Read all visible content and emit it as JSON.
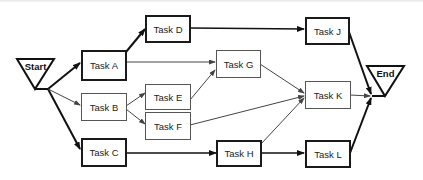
{
  "diagram": {
    "type": "network-diagram",
    "start": {
      "label": "Start"
    },
    "end": {
      "label": "End"
    },
    "tasks": [
      {
        "id": "A",
        "label": "Task A",
        "critical": true
      },
      {
        "id": "B",
        "label": "Task B",
        "critical": false
      },
      {
        "id": "C",
        "label": "Task C",
        "critical": true
      },
      {
        "id": "D",
        "label": "Task D",
        "critical": true
      },
      {
        "id": "E",
        "label": "Task E",
        "critical": false
      },
      {
        "id": "F",
        "label": "Task F",
        "critical": false
      },
      {
        "id": "G",
        "label": "Task G",
        "critical": false
      },
      {
        "id": "H",
        "label": "Task H",
        "critical": true
      },
      {
        "id": "J",
        "label": "Task J",
        "critical": true
      },
      {
        "id": "K",
        "label": "Task K",
        "critical": false
      },
      {
        "id": "L",
        "label": "Task L",
        "critical": true
      }
    ],
    "edges": [
      {
        "from": "Start",
        "to": "A",
        "critical": true
      },
      {
        "from": "Start",
        "to": "B",
        "critical": false
      },
      {
        "from": "Start",
        "to": "C",
        "critical": true
      },
      {
        "from": "A",
        "to": "D",
        "critical": true
      },
      {
        "from": "A",
        "to": "G",
        "critical": false
      },
      {
        "from": "B",
        "to": "E",
        "critical": false
      },
      {
        "from": "B",
        "to": "F",
        "critical": false
      },
      {
        "from": "E",
        "to": "G",
        "critical": false
      },
      {
        "from": "F",
        "to": "K",
        "critical": false
      },
      {
        "from": "G",
        "to": "K",
        "critical": false
      },
      {
        "from": "C",
        "to": "H",
        "critical": true
      },
      {
        "from": "H",
        "to": "K",
        "critical": false
      },
      {
        "from": "H",
        "to": "L",
        "critical": true
      },
      {
        "from": "D",
        "to": "J",
        "critical": true
      },
      {
        "from": "J",
        "to": "End",
        "critical": true
      },
      {
        "from": "K",
        "to": "End",
        "critical": false
      },
      {
        "from": "L",
        "to": "End",
        "critical": true
      }
    ]
  }
}
